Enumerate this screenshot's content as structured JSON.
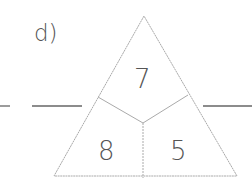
{
  "exercise": {
    "label": "d)",
    "top": "7",
    "bottom_left": "8",
    "bottom_right": "5"
  },
  "colors": {
    "line": "#9a9a9a",
    "text": "#555555"
  }
}
